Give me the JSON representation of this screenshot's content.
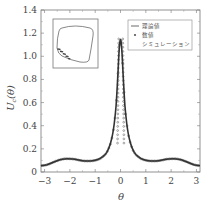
{
  "chart_data": {
    "type": "line",
    "title": "",
    "xlabel": "θ",
    "ylabel": "U_c(θ)",
    "ylabel_main": "U",
    "ylabel_sub": "c",
    "ylabel_arg": "(θ)",
    "xlim": [
      -3.14,
      3.14
    ],
    "ylim": [
      0,
      1.4
    ],
    "xticks": [
      -3,
      -2,
      -1,
      0,
      1,
      2,
      3
    ],
    "xtick_labels": [
      "−3",
      "−2",
      "−1",
      "0",
      "1",
      "2",
      "3"
    ],
    "yticks": [
      0,
      0.2,
      0.4,
      0.6,
      0.8,
      1.0,
      1.2,
      1.4
    ],
    "ytick_labels": [
      "0",
      "0.2",
      "0.4",
      "0.6",
      "0.8",
      "1.0",
      "1.2",
      "1.4"
    ],
    "grid": false,
    "legend_position": "upper right",
    "series": [
      {
        "name": "理論値",
        "style": "line",
        "x": [
          -3.14,
          -3.0,
          -2.8,
          -2.6,
          -2.4,
          -2.2,
          -2.0,
          -1.8,
          -1.6,
          -1.4,
          -1.2,
          -1.0,
          -0.8,
          -0.6,
          -0.5,
          -0.4,
          -0.3,
          -0.2,
          -0.15,
          -0.1,
          -0.05,
          0.0,
          0.05,
          0.1,
          0.15,
          0.2,
          0.3,
          0.4,
          0.5,
          0.6,
          0.8,
          1.0,
          1.2,
          1.4,
          1.6,
          1.8,
          2.0,
          2.2,
          2.4,
          2.6,
          2.8,
          3.0,
          3.14
        ],
        "values": [
          0.055,
          0.057,
          0.07,
          0.09,
          0.105,
          0.115,
          0.115,
          0.11,
          0.1,
          0.095,
          0.095,
          0.1,
          0.115,
          0.15,
          0.185,
          0.24,
          0.33,
          0.5,
          0.65,
          0.85,
          1.08,
          1.17,
          1.08,
          0.85,
          0.65,
          0.5,
          0.33,
          0.24,
          0.185,
          0.15,
          0.115,
          0.1,
          0.095,
          0.095,
          0.1,
          0.11,
          0.115,
          0.115,
          0.105,
          0.09,
          0.07,
          0.057,
          0.055
        ]
      },
      {
        "name": "数値シミュレーション",
        "style": "markers",
        "note": "dense markers overlapping the theoretical curve"
      }
    ],
    "inset": {
      "description": "closed rounded-square orbit with dense markers clustered at lower-left",
      "has_frame": true
    }
  },
  "legend": {
    "items": [
      {
        "symbol": "—",
        "label": "理論値"
      },
      {
        "symbol": "•",
        "label": "数値"
      }
    ],
    "continuation": "シミュレーション"
  },
  "colors": {
    "curve": "#333333",
    "marker": "#555555",
    "frame": "#666666",
    "text": "#444444"
  }
}
